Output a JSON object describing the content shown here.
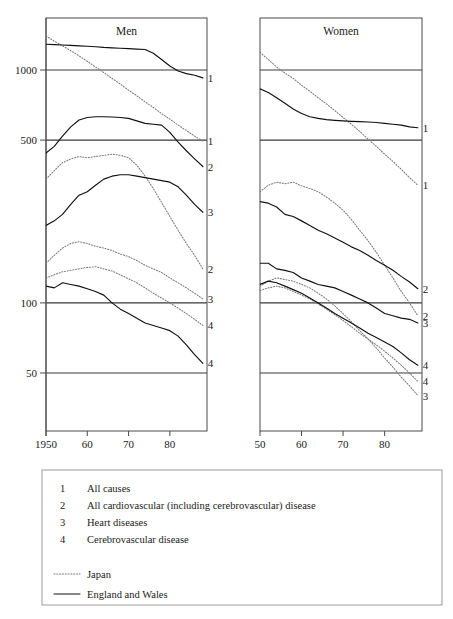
{
  "chart_data": {
    "type": "line",
    "title": "",
    "xlabel": "",
    "ylabel": "",
    "y_scale": "log",
    "ylim": [
      40,
      1600
    ],
    "y_ticks": [
      1000,
      500,
      100,
      50
    ],
    "y_tick_labels": [
      "1000",
      "500",
      "100",
      "50"
    ],
    "grid": "horizontal-at-y-ticks",
    "legend_position": "below-plot-in-box",
    "panels": [
      {
        "title": "Men",
        "xlim": [
          1950,
          1989
        ],
        "x_ticks": [
          1950,
          1960,
          1970,
          1980
        ],
        "x_tick_labels": [
          "1950",
          "60",
          "70",
          "80"
        ],
        "series": [
          {
            "name": "Japan All causes",
            "country": "Japan",
            "cause_number": "1",
            "style": "dotted",
            "end_label": "1",
            "x": [
              1950,
              1952,
              1954,
              1956,
              1958,
              1960,
              1962,
              1964,
              1966,
              1968,
              1970,
              1972,
              1974,
              1976,
              1978,
              1980,
              1982,
              1984,
              1986,
              1988
            ],
            "y": [
              1400,
              1330,
              1270,
              1210,
              1150,
              1090,
              1030,
              975,
              920,
              870,
              820,
              775,
              730,
              690,
              650,
              615,
              580,
              550,
              520,
              495
            ]
          },
          {
            "name": "England and Wales All causes",
            "country": "England and Wales",
            "cause_number": "1",
            "style": "solid",
            "end_label": "1",
            "x": [
              1950,
              1952,
              1954,
              1956,
              1958,
              1960,
              1962,
              1964,
              1966,
              1968,
              1970,
              1972,
              1974,
              1976,
              1978,
              1980,
              1982,
              1984,
              1986,
              1988
            ],
            "y": [
              1290,
              1285,
              1280,
              1275,
              1270,
              1265,
              1258,
              1250,
              1245,
              1240,
              1235,
              1230,
              1225,
              1180,
              1110,
              1040,
              990,
              965,
              950,
              925
            ]
          },
          {
            "name": "Japan All cardiovascular (including cerebrovascular) disease",
            "country": "Japan",
            "cause_number": "2",
            "style": "dotted",
            "end_label": "2",
            "x": [
              1950,
              1952,
              1954,
              1956,
              1958,
              1960,
              1962,
              1964,
              1966,
              1968,
              1970,
              1972,
              1974,
              1976,
              1978,
              1980,
              1982,
              1984,
              1986,
              1988
            ],
            "y": [
              340,
              370,
              400,
              415,
              425,
              420,
              425,
              430,
              435,
              430,
              420,
              390,
              350,
              310,
              270,
              235,
              205,
              180,
              160,
              140
            ]
          },
          {
            "name": "England and Wales All cardiovascular (including cerebrovascular) disease",
            "country": "England and Wales",
            "cause_number": "2",
            "style": "solid",
            "end_label": "2",
            "x": [
              1950,
              1952,
              1954,
              1956,
              1958,
              1960,
              1962,
              1964,
              1966,
              1968,
              1970,
              1972,
              1974,
              1976,
              1978,
              1980,
              1982,
              1984,
              1986,
              1988
            ],
            "y": [
              440,
              470,
              520,
              570,
              610,
              625,
              630,
              630,
              628,
              625,
              620,
              605,
              590,
              585,
              580,
              540,
              490,
              450,
              415,
              385
            ]
          },
          {
            "name": "Japan Heart diseases",
            "country": "Japan",
            "cause_number": "3",
            "style": "dotted",
            "end_label": "3",
            "x": [
              1950,
              1952,
              1954,
              1956,
              1958,
              1960,
              1962,
              1964,
              1966,
              1968,
              1970,
              1972,
              1974,
              1976,
              1978,
              1980,
              1982,
              1984,
              1986,
              1988
            ],
            "y": [
              148,
              160,
              172,
              180,
              183,
              180,
              175,
              172,
              168,
              162,
              158,
              152,
              145,
              140,
              135,
              128,
              122,
              116,
              110,
              104
            ]
          },
          {
            "name": "England and Wales Heart diseases",
            "country": "England and Wales",
            "cause_number": "3",
            "style": "solid",
            "end_label": "3",
            "x": [
              1950,
              1952,
              1954,
              1956,
              1958,
              1960,
              1962,
              1964,
              1966,
              1968,
              1970,
              1972,
              1974,
              1976,
              1978,
              1980,
              1982,
              1984,
              1986,
              1988
            ],
            "y": [
              215,
              225,
              240,
              265,
              290,
              300,
              320,
              340,
              350,
              355,
              355,
              350,
              345,
              340,
              335,
              330,
              315,
              290,
              265,
              245
            ]
          },
          {
            "name": "Japan Cerebrovascular disease",
            "country": "Japan",
            "cause_number": "4",
            "style": "dotted",
            "end_label": "4",
            "x": [
              1950,
              1952,
              1954,
              1956,
              1958,
              1960,
              1962,
              1964,
              1966,
              1968,
              1970,
              1972,
              1974,
              1976,
              1978,
              1980,
              1982,
              1984,
              1986,
              1988
            ],
            "y": [
              128,
              132,
              136,
              138,
              140,
              142,
              143,
              140,
              137,
              132,
              127,
              122,
              116,
              110,
              105,
              100,
              95,
              90,
              85,
              80
            ]
          },
          {
            "name": "England and Wales Cerebrovascular disease",
            "country": "England and Wales",
            "cause_number": "4",
            "style": "solid",
            "end_label": "4",
            "x": [
              1950,
              1952,
              1954,
              1956,
              1958,
              1960,
              1962,
              1964,
              1966,
              1968,
              1970,
              1972,
              1974,
              1976,
              1978,
              1980,
              1982,
              1984,
              1986,
              1988
            ],
            "y": [
              118,
              116,
              122,
              120,
              118,
              115,
              112,
              108,
              100,
              94,
              90,
              86,
              82,
              80,
              78,
              76,
              72,
              66,
              60,
              55
            ]
          }
        ]
      },
      {
        "title": "Women",
        "xlim": [
          1950,
          1989
        ],
        "x_ticks": [
          1950,
          1960,
          1970,
          1980
        ],
        "x_tick_labels": [
          "50",
          "60",
          "70",
          "80"
        ],
        "series": [
          {
            "name": "Japan All causes",
            "country": "Japan",
            "cause_number": "1",
            "style": "dotted",
            "end_label": "1",
            "x": [
              1950,
              1952,
              1954,
              1956,
              1958,
              1960,
              1962,
              1964,
              1966,
              1968,
              1970,
              1972,
              1974,
              1976,
              1978,
              1980,
              1982,
              1984,
              1986,
              1988
            ],
            "y": [
              1190,
              1110,
              1030,
              970,
              920,
              860,
              810,
              760,
              715,
              670,
              625,
              585,
              545,
              505,
              470,
              435,
              405,
              375,
              345,
              320
            ]
          },
          {
            "name": "England and Wales All causes",
            "country": "England and Wales",
            "cause_number": "1",
            "style": "solid",
            "end_label": "1",
            "x": [
              1950,
              1952,
              1954,
              1956,
              1958,
              1960,
              1962,
              1964,
              1966,
              1968,
              1970,
              1972,
              1974,
              1976,
              1978,
              1980,
              1982,
              1984,
              1986,
              1988
            ],
            "y": [
              830,
              800,
              760,
              720,
              680,
              650,
              630,
              620,
              612,
              608,
              605,
              602,
              600,
              598,
              595,
              590,
              585,
              580,
              570,
              565
            ]
          },
          {
            "name": "Japan All cardiovascular (including cerebrovascular) disease",
            "country": "Japan",
            "cause_number": "2",
            "style": "dotted",
            "end_label": "2",
            "x": [
              1950,
              1952,
              1954,
              1956,
              1958,
              1960,
              1962,
              1964,
              1966,
              1968,
              1970,
              1972,
              1974,
              1976,
              1978,
              1980,
              1982,
              1984,
              1986,
              1988
            ],
            "y": [
              300,
              320,
              330,
              325,
              330,
              318,
              310,
              300,
              285,
              268,
              250,
              228,
              205,
              185,
              165,
              145,
              128,
              112,
              100,
              88
            ]
          },
          {
            "name": "England and Wales All cardiovascular (including cerebrovascular) disease",
            "country": "England and Wales",
            "cause_number": "2",
            "style": "solid",
            "end_label": "2",
            "x": [
              1950,
              1952,
              1954,
              1956,
              1958,
              1960,
              1962,
              1964,
              1966,
              1968,
              1970,
              1972,
              1974,
              1976,
              1978,
              1980,
              1982,
              1984,
              1986,
              1988
            ],
            "y": [
              272,
              268,
              258,
              240,
              235,
              225,
              215,
              205,
              198,
              190,
              182,
              174,
              168,
              160,
              152,
              145,
              138,
              130,
              123,
              115
            ]
          },
          {
            "name": "Japan Heart diseases",
            "country": "Japan",
            "cause_number": "3",
            "style": "dotted",
            "end_label": "3",
            "x": [
              1950,
              1952,
              1954,
              1956,
              1958,
              1960,
              1962,
              1964,
              1966,
              1968,
              1970,
              1972,
              1974,
              1976,
              1978,
              1980,
              1982,
              1984,
              1986,
              1988
            ],
            "y": [
              118,
              124,
              128,
              126,
              124,
              120,
              116,
              110,
              104,
              97,
              90,
              83,
              76,
              70,
              64,
              58,
              53,
              48,
              44,
              40
            ]
          },
          {
            "name": "England and Wales Heart diseases",
            "country": "England and Wales",
            "cause_number": "3",
            "style": "solid",
            "end_label": "3",
            "x": [
              1950,
              1952,
              1954,
              1956,
              1958,
              1960,
              1962,
              1964,
              1966,
              1968,
              1970,
              1972,
              1974,
              1976,
              1978,
              1980,
              1982,
              1984,
              1986,
              1988
            ],
            "y": [
              148,
              148,
              140,
              138,
              135,
              128,
              124,
              120,
              118,
              116,
              112,
              108,
              104,
              100,
              95,
              90,
              88,
              86,
              85,
              82
            ]
          },
          {
            "name": "Japan Cerebrovascular disease",
            "country": "Japan",
            "cause_number": "4",
            "style": "dotted",
            "end_label": "4",
            "x": [
              1950,
              1952,
              1954,
              1956,
              1958,
              1960,
              1962,
              1964,
              1966,
              1968,
              1970,
              1972,
              1974,
              1976,
              1978,
              1980,
              1982,
              1984,
              1986,
              1988
            ],
            "y": [
              113,
              116,
              118,
              116,
              112,
              108,
              104,
              99,
              94,
              89,
              84,
              79,
              74,
              70,
              66,
              62,
              58,
              54,
              50,
              46
            ]
          },
          {
            "name": "England and Wales Cerebrovascular disease",
            "country": "England and Wales",
            "cause_number": "4",
            "style": "solid",
            "end_label": "4",
            "x": [
              1950,
              1952,
              1954,
              1956,
              1958,
              1960,
              1962,
              1964,
              1966,
              1968,
              1970,
              1972,
              1974,
              1976,
              1978,
              1980,
              1982,
              1984,
              1986,
              1988
            ],
            "y": [
              120,
              124,
              122,
              118,
              114,
              110,
              105,
              100,
              95,
              90,
              86,
              82,
              78,
              74,
              71,
              68,
              65,
              61,
              57,
              54
            ]
          }
        ]
      }
    ],
    "legend": {
      "causes": [
        {
          "number": "1",
          "label": "All causes"
        },
        {
          "number": "2",
          "label": "All cardiovascular (including cerebrovascular) disease"
        },
        {
          "number": "3",
          "label": "Heart diseases"
        },
        {
          "number": "4",
          "label": "Cerebrovascular disease"
        }
      ],
      "styles": [
        {
          "style": "dotted",
          "label": "Japan"
        },
        {
          "style": "solid",
          "label": "England and Wales"
        }
      ]
    },
    "colors": {
      "solid": "#111111",
      "dotted": "#7a7a7a",
      "frame": "#4a4a4a",
      "grid": "#3a3a3a",
      "text": "#1a1a1a",
      "background": "#ffffff"
    }
  }
}
